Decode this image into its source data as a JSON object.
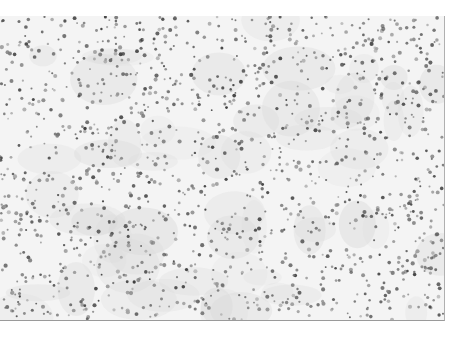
{
  "image": {
    "subject": "histology micrograph of densely scattered stained cell nuclei",
    "background_color": "#f4f4f4",
    "nucleus_color": "#5a5a5a",
    "region": {
      "x": 0,
      "y": 16,
      "width": 444,
      "height": 304
    },
    "approx_nuclei_count": 1400
  }
}
